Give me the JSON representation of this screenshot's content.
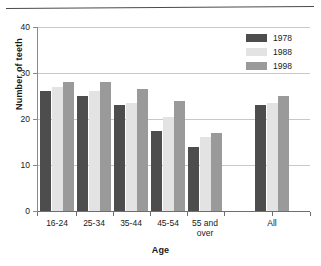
{
  "chart_data": {
    "type": "bar",
    "title": "",
    "subtitle": "",
    "xlabel": "Age",
    "ylabel": "Number of teeth",
    "categories": [
      "16-24",
      "25-34",
      "35-44",
      "45-54",
      "55 and over",
      "All"
    ],
    "series": [
      {
        "name": "1978",
        "color": "#4d4d4d",
        "values": [
          26,
          25,
          23,
          17.5,
          14,
          23
        ]
      },
      {
        "name": "1988",
        "color": "#e3e3e3",
        "values": [
          27,
          26,
          23.5,
          20.5,
          16,
          23.5
        ]
      },
      {
        "name": "1998",
        "color": "#9a9a9a",
        "values": [
          28,
          28,
          26.5,
          24,
          17,
          25
        ]
      }
    ],
    "ylim": [
      0,
      40
    ],
    "yticks": [
      0,
      10,
      20,
      30,
      40
    ],
    "ytick_labels": [
      "0",
      "10",
      "20",
      "30",
      "40"
    ],
    "grid": "horizontal",
    "legend_position": "top-right",
    "legend_entries": [
      "1978",
      "1988",
      "1998"
    ]
  },
  "layout": {
    "plot_left": 38,
    "plot_top": 27,
    "plot_width": 272,
    "plot_height": 184,
    "group_width": 37,
    "bar_width": 11,
    "group_x": [
      2,
      39,
      76,
      113,
      150,
      217
    ],
    "gap_before_all": true
  }
}
